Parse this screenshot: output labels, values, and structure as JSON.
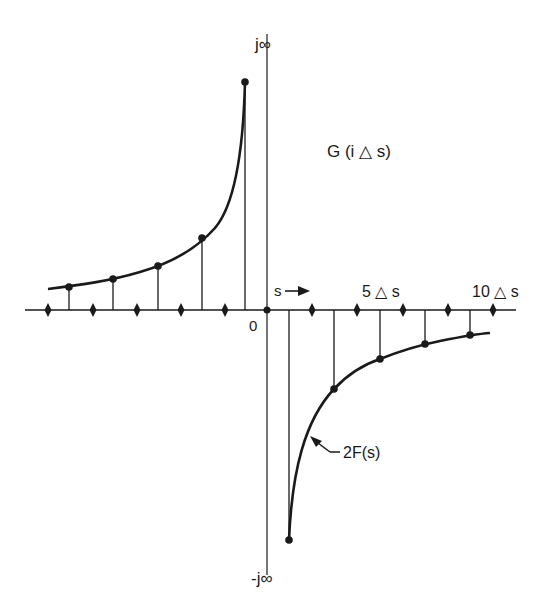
{
  "diagram": {
    "title": "G (i △ s)",
    "labels": {
      "top_axis": "j∞",
      "bottom_axis": "-j∞",
      "origin": "0",
      "s_arrow": "s",
      "tick_5": "5 △ s",
      "tick_10": "10 △ s",
      "curve": "2F(s)"
    },
    "colors": {
      "ink": "#1a1a1a",
      "background": "#ffffff"
    },
    "sample_spacing": "△ s",
    "left_samples_x": [
      69,
      113,
      158,
      202,
      245
    ],
    "left_samples_y": [
      287,
      279,
      266,
      238,
      82
    ],
    "right_samples_x": [
      289,
      334,
      380,
      425,
      470
    ],
    "right_samples_y": [
      540,
      389,
      359,
      344,
      335
    ],
    "tick_marks_left_x": [
      48,
      93,
      137,
      181,
      225
    ],
    "tick_marks_right_x": [
      312,
      357,
      403,
      448,
      493
    ]
  }
}
